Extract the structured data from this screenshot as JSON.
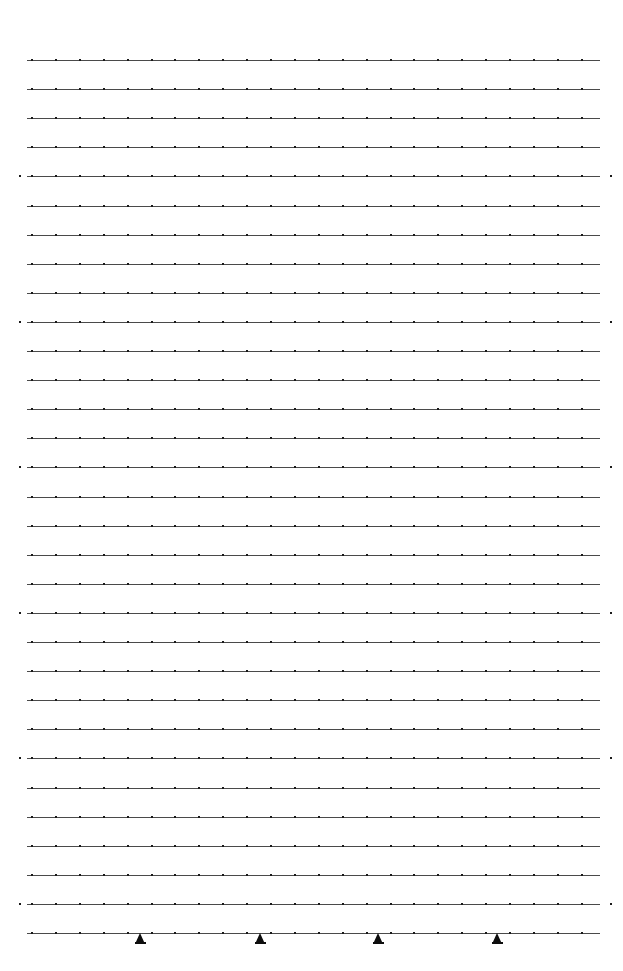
{
  "document": {
    "title": "Ruled Grid Sheet",
    "page_width": 623,
    "page_height": 971,
    "background_color": "#ffffff"
  },
  "grid": {
    "line_color": "#4a4a4a",
    "dot_color": "#1a1a1a",
    "marker_color": "#0d0d0d",
    "line_count": 31,
    "first_line_y": 60,
    "line_spacing": 29.1,
    "line_start_x": 27,
    "line_end_x": 600,
    "tick_spacing": 23.9,
    "tick_count_per_line": 24,
    "edge_dot_interval_lines": 5,
    "edge_dot_left_x": 19,
    "edge_dot_right_x": 610
  },
  "markers": {
    "row_index": 30,
    "count": 4,
    "positions_x": [
      140,
      260,
      378,
      497
    ],
    "shape": "triangle-up"
  },
  "chart_data": {
    "type": "scatter",
    "title": "",
    "xlabel": "",
    "ylabel": "",
    "x": [
      140,
      260,
      378,
      497
    ],
    "values": [
      1,
      1,
      1,
      1
    ],
    "grid": true,
    "legend": "none"
  }
}
